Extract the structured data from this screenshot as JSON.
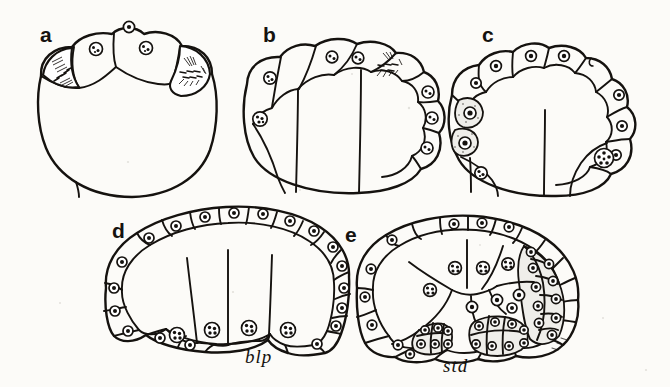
{
  "figure": {
    "kind": "scientific-illustration",
    "background_color": "#fcfbf8",
    "ink_color": "#15120f",
    "nucleus_fill": "#ffffff",
    "granular_cell_fill": "#efeeea",
    "panel_count": 5
  },
  "panels": [
    {
      "id": "a",
      "letter": "a",
      "caption": "",
      "description": "Early embryo: rounded blastula with four large apical cells, two of which contain mitotic spindles",
      "mitotic_cells": 2,
      "nucleated_cells": 3
    },
    {
      "id": "b",
      "letter": "b",
      "caption": "",
      "description": "Embryo with an arc of flattened epithelial cells across the animal pole and two large interior blastomeres",
      "mitotic_cells": 1,
      "nucleated_cells": 8
    },
    {
      "id": "c",
      "letter": "c",
      "caption": "",
      "description": "Embryo completely ringed by epithelium; granular stippled cells along the left flank, large nucleated cell at lower right",
      "mitotic_cells": 0,
      "nucleated_cells": 16
    },
    {
      "id": "d",
      "letter": "d",
      "caption": "blp",
      "caption_full": "blastopore",
      "description": "Gastrula with continuous epithelial layer and four large endodermal cells meeting at the blastopore",
      "mitotic_cells": 0,
      "nucleated_cells": 24
    },
    {
      "id": "e",
      "letter": "e",
      "caption": "std",
      "caption_full": "stomodeum",
      "description": "Later embryo with invaginating cell masses forming the stomodeum on the ventral surface",
      "mitotic_cells": 0,
      "nucleated_cells": 38
    }
  ],
  "labels": {
    "panel_a": "a",
    "panel_b": "b",
    "panel_c": "c",
    "panel_d": "d",
    "panel_e": "e",
    "blastopore": "blp",
    "stomodeum": "std"
  }
}
